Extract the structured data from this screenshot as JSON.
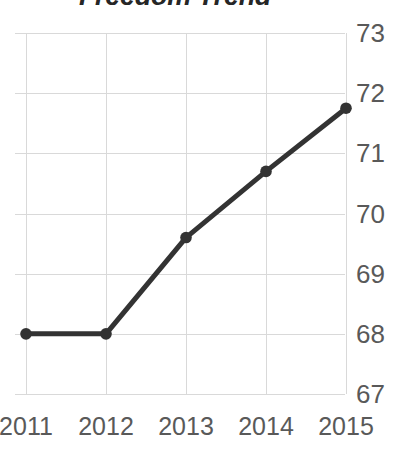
{
  "chart_data": {
    "type": "line",
    "title": "Freedom Trend",
    "xlabel": "",
    "ylabel": "",
    "categories": [
      "2011",
      "2012",
      "2013",
      "2014",
      "2015"
    ],
    "values": [
      68.0,
      68.0,
      69.6,
      70.7,
      71.75
    ],
    "series": [
      {
        "name": "Freedom Score",
        "values": [
          68.0,
          68.0,
          69.6,
          70.7,
          71.75
        ]
      }
    ],
    "x_tick_labels": [
      "2011",
      "2012",
      "2013",
      "2014",
      "2015"
    ],
    "y_tick_labels": [
      "73",
      "72",
      "71",
      "70",
      "69",
      "68",
      "67"
    ],
    "y_tick_values": [
      73,
      72,
      71,
      70,
      69,
      68,
      67
    ],
    "ylim": [
      67,
      73
    ],
    "grid": "both",
    "legend": "none",
    "marker": "circle",
    "line_color": "#333333",
    "marker_color": "#333333",
    "grid_color": "#d9d9d9",
    "tick_label_color": "#595959",
    "title_color": "#262626",
    "y_axis_position": "right"
  }
}
